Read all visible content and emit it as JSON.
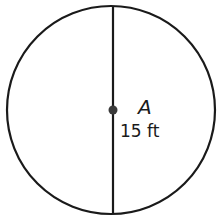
{
  "diagram": {
    "type": "circle-with-diameter",
    "center_label": "A",
    "measurement_label": "15 ft",
    "colors": {
      "stroke": "#1a1a1a",
      "point": "#3a3a3a",
      "background": "#ffffff"
    }
  }
}
